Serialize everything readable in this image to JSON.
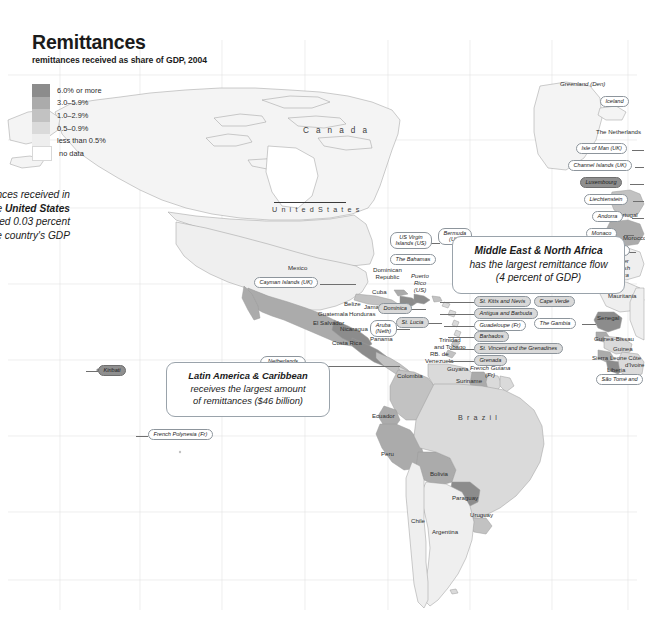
{
  "title": "Remittances",
  "subtitle": "remittances received as share of GDP, 2004",
  "legend": {
    "name": "remittances-legend",
    "items": [
      {
        "label": "6.0% or more",
        "color": "#8c8c8c"
      },
      {
        "label": "3.0–5.9%",
        "color": "#ababab"
      },
      {
        "label": "1.0–2.9%",
        "color": "#c2c2c2"
      },
      {
        "label": "0.5–0.9%",
        "color": "#dadada"
      },
      {
        "label": "less than 0.5%",
        "color": "#eeeeee"
      },
      {
        "label": "no data",
        "color": "#ffffff"
      }
    ]
  },
  "callouts": [
    {
      "id": "callout-us",
      "lines": [
        "Remittances received in",
        "2005 in the United States",
        "only totaled 0.03 percent",
        "of the country's GDP"
      ],
      "bold_phrase": "United States"
    },
    {
      "id": "callout-mena",
      "lines": [
        "Middle East & North Africa",
        "has the largest remittance flow",
        "(4 percent of GDP)"
      ],
      "bold_phrase": "Middle East & North Africa"
    },
    {
      "id": "callout-lac",
      "lines": [
        "Latin America & Caribbean",
        "receives the largest amount",
        "of remittances ($46 billion)"
      ],
      "bold_phrase": "Latin America & Caribbean"
    }
  ],
  "map_labels": [
    {
      "name": "label-canada",
      "text": "C a n a d a"
    },
    {
      "name": "label-united-states",
      "text": "U n i t e d   S t a t e s"
    },
    {
      "name": "label-greenland",
      "text": "Greenland (Den)"
    },
    {
      "name": "label-mexico",
      "text": "Mexico"
    },
    {
      "name": "label-belize",
      "text": "Belize"
    },
    {
      "name": "label-guatemala",
      "text": "Guatemala"
    },
    {
      "name": "label-honduras",
      "text": "Honduras"
    },
    {
      "name": "label-el-salvador",
      "text": "El Salvador"
    },
    {
      "name": "label-nicaragua",
      "text": "Nicaragua"
    },
    {
      "name": "label-costa-rica",
      "text": "Costa Rica"
    },
    {
      "name": "label-panama",
      "text": "Panama"
    },
    {
      "name": "label-cuba",
      "text": "Cuba"
    },
    {
      "name": "label-jamaica",
      "text": "Jamaica"
    },
    {
      "name": "label-haiti",
      "text": "Haiti"
    },
    {
      "name": "label-dominican-republic",
      "text": "Dominican\nRepublic"
    },
    {
      "name": "label-puerto-rico",
      "text": "Puerto\nRico\n(US)"
    },
    {
      "name": "label-trinidad-tobago",
      "text": "Trinidad\nand Tobago"
    },
    {
      "name": "label-venezuela",
      "text": "RB. de\nVenezuela"
    },
    {
      "name": "label-colombia",
      "text": "Colombia"
    },
    {
      "name": "label-guyana",
      "text": "Guyana"
    },
    {
      "name": "label-suriname",
      "text": "Suriname"
    },
    {
      "name": "label-ecuador",
      "text": "Ecuador"
    },
    {
      "name": "label-peru",
      "text": "Peru"
    },
    {
      "name": "label-brazil",
      "text": "B r a z i l"
    },
    {
      "name": "label-bolivia",
      "text": "Bolivia"
    },
    {
      "name": "label-paraguay",
      "text": "Paraguay"
    },
    {
      "name": "label-chile",
      "text": "Chile"
    },
    {
      "name": "label-argentina",
      "text": "Argentina"
    },
    {
      "name": "label-uruguay",
      "text": "Uruguay"
    },
    {
      "name": "label-netherlands",
      "text": "The Netherlands"
    },
    {
      "name": "label-portugal",
      "text": "Portugal"
    },
    {
      "name": "label-morocco",
      "text": "Morocco"
    },
    {
      "name": "label-former-spanish-sahara",
      "text": "Former\nSpanish\nSahara"
    },
    {
      "name": "label-mauritania",
      "text": "Mauritania"
    },
    {
      "name": "label-senegal",
      "text": "Senegal"
    },
    {
      "name": "label-guinea-bissau",
      "text": "Guinea-Bissau"
    },
    {
      "name": "label-guinea",
      "text": "Guinea"
    },
    {
      "name": "label-sierra-leone",
      "text": "Sierra Leone"
    },
    {
      "name": "label-liberia",
      "text": "Liberia"
    },
    {
      "name": "label-cote-divoire",
      "text": "Côte\nd'Ivoire"
    },
    {
      "name": "label-french-guiana",
      "text": "French Guiana\n(Fr)"
    }
  ],
  "pill_labels": [
    {
      "name": "pill-iceland",
      "text": "Iceland"
    },
    {
      "name": "pill-isle-of-man",
      "text": "Isle of Man (UK)"
    },
    {
      "name": "pill-channel-islands",
      "text": "Channel Islands (UK)"
    },
    {
      "name": "pill-luxembourg",
      "text": "Luxembourg"
    },
    {
      "name": "pill-liechtenstein",
      "text": "Liechtenstein"
    },
    {
      "name": "pill-andorra",
      "text": "Andorra"
    },
    {
      "name": "pill-monaco",
      "text": "Monaco"
    },
    {
      "name": "pill-gibraltar",
      "text": "Gibraltar (UK)"
    },
    {
      "name": "pill-bermuda",
      "text": "Bermuda\n(UK)"
    },
    {
      "name": "pill-us-virgin-islands",
      "text": "US Virgin\nIslands (US)"
    },
    {
      "name": "pill-the-bahamas",
      "text": "The Bahamas"
    },
    {
      "name": "pill-cayman-islands",
      "text": "Cayman Islands (UK)"
    },
    {
      "name": "pill-aruba",
      "text": "Aruba\n(Neth)"
    },
    {
      "name": "pill-netherlands-antilles",
      "text": "Netherlands\nAntilles (Neth)"
    },
    {
      "name": "pill-dominica",
      "text": "Dominica"
    },
    {
      "name": "pill-st-lucia",
      "text": "St. Lucia"
    },
    {
      "name": "pill-st-kitts-nevis",
      "text": "St. Kitts and Nevis"
    },
    {
      "name": "pill-antigua-barbuda",
      "text": "Antigua and Barbuda"
    },
    {
      "name": "pill-guadeloupe",
      "text": "Guadeloupe (Fr)"
    },
    {
      "name": "pill-barbados",
      "text": "Barbados"
    },
    {
      "name": "pill-st-vincent-grenadines",
      "text": "St. Vincent and the Grenadines"
    },
    {
      "name": "pill-grenada",
      "text": "Grenada"
    },
    {
      "name": "pill-cape-verde",
      "text": "Cape Verde"
    },
    {
      "name": "pill-the-gambia",
      "text": "The Gambia"
    },
    {
      "name": "pill-sao-tome",
      "text": "São Tomé and"
    },
    {
      "name": "pill-kiribati",
      "text": "Kiribati"
    },
    {
      "name": "pill-french-polynesia",
      "text": "French Polynesia (Fr)"
    }
  ]
}
